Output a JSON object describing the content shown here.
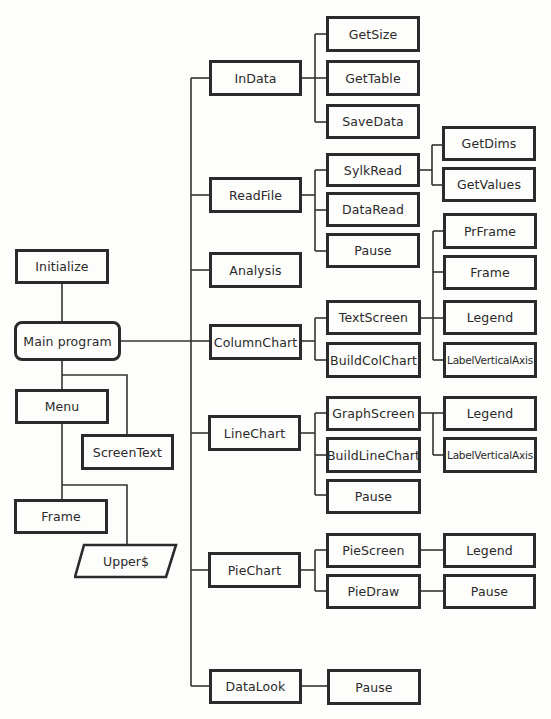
{
  "diagram": {
    "type": "program structure chart",
    "left_column": {
      "initialize": "Initialize",
      "main_program": "Main program",
      "menu": "Menu",
      "screen_text": "ScreenText",
      "frame": "Frame",
      "upper": "Upper$"
    },
    "modules": {
      "indata": {
        "label": "InData",
        "children": [
          "GetSize",
          "GetTable",
          "SaveData"
        ]
      },
      "readfile": {
        "label": "ReadFile",
        "children": [
          "SylkRead",
          "DataRead",
          "Pause"
        ],
        "sylkread_children": [
          "GetDims",
          "GetValues"
        ]
      },
      "analysis": {
        "label": "Analysis"
      },
      "columnchart": {
        "label": "ColumnChart",
        "children": [
          "TextScreen",
          "BuildColChart"
        ],
        "textscreen_children": [
          "PrFrame",
          "Frame",
          "Legend",
          "LabelVerticalAxis"
        ]
      },
      "linechart": {
        "label": "LineChart",
        "children": [
          "GraphScreen",
          "BuildLineChart",
          "Pause"
        ],
        "graphscreen_children": [
          "Legend",
          "LabelVerticalAxis"
        ]
      },
      "piechart": {
        "label": "PieChart",
        "children": [
          "PieScreen",
          "PieDraw"
        ],
        "piescreen_children": [
          "Legend"
        ],
        "piedraw_children": [
          "Pause"
        ]
      },
      "datalook": {
        "label": "DataLook",
        "children": [
          "Pause"
        ]
      }
    }
  }
}
